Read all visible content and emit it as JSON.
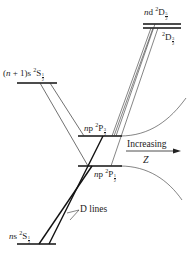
{
  "diagram": {
    "levels": [
      {
        "id": "nd_2D_5_2",
        "config": "n",
        "orbital": "d",
        "term": "2D",
        "j_num": "5",
        "j_den": "2"
      },
      {
        "id": "nd_2D_3_2",
        "term": "2D",
        "j_num": "3",
        "j_den": "2"
      },
      {
        "id": "n1s_2S_1_2",
        "config": "(n + 1)",
        "orbital": "s",
        "term": "2S",
        "j_num": "1",
        "j_den": "2"
      },
      {
        "id": "np_2P_3_2",
        "config": "n",
        "orbital": "p",
        "term": "2P",
        "j_num": "3",
        "j_den": "2"
      },
      {
        "id": "np_2P_1_2",
        "config": "n",
        "orbital": "p",
        "term": "2P",
        "j_num": "1",
        "j_den": "2"
      },
      {
        "id": "ns_2S_1_2",
        "config": "n",
        "orbital": "s",
        "term": "2S",
        "j_num": "1",
        "j_den": "2"
      }
    ],
    "annotations": {
      "d_lines": "D lines",
      "increasing": "Increasing",
      "z": "Z"
    },
    "labels": {
      "nd_prefix": "n",
      "nd_orb": "d",
      "term_D_sup": "2",
      "term_D": "D",
      "term_P_sup": "2",
      "term_P": "P",
      "term_S_sup": "2",
      "term_S": "S",
      "n1s_prefix": "(",
      "n1s_n": "n",
      "n1s_rest": " + 1)s",
      "np_n": "n",
      "np_orb": "p",
      "ns_n": "n",
      "ns_orb": "s",
      "half_num": "1",
      "half_den": "2",
      "threehalf_num": "3",
      "fivehalf_num": "5"
    }
  }
}
